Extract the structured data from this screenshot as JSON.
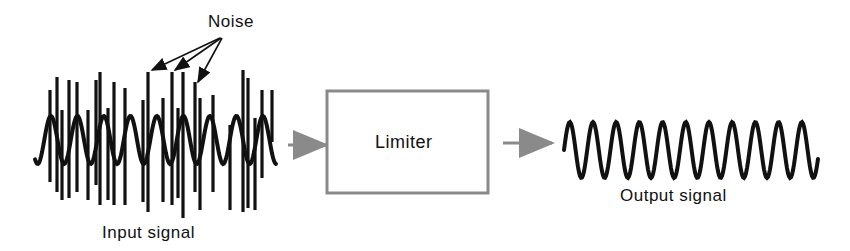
{
  "diagram": {
    "type": "block-diagram",
    "colors": {
      "signal": "#111111",
      "block": "#8a8a8a",
      "arrow": "#8a8a8a",
      "text": "#111111"
    },
    "labels": {
      "noise": "Noise",
      "input_signal": "Input signal",
      "block": "Limiter",
      "output_signal": "Output signal"
    },
    "nodes": [
      {
        "id": "input",
        "label": "Input signal",
        "kind": "waveform-with-noise"
      },
      {
        "id": "limiter",
        "label": "Limiter",
        "kind": "block"
      },
      {
        "id": "output",
        "label": "Output signal",
        "kind": "clean-sine"
      }
    ],
    "edges": [
      {
        "from": "input",
        "to": "limiter"
      },
      {
        "from": "limiter",
        "to": "output"
      }
    ],
    "annotations": [
      {
        "text": "Noise",
        "points_to": "three noise spikes on input signal",
        "arrow_count": 3
      }
    ]
  }
}
